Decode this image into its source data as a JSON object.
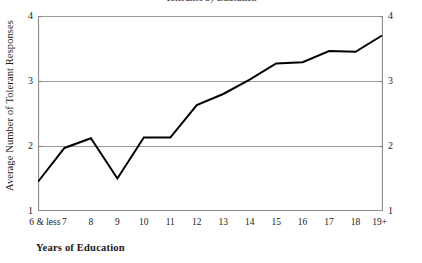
{
  "figure": {
    "title_remnant": "Tolerance by Education",
    "background": "#ffffff",
    "line_color": "#000000",
    "grid_color": "#9a9a9a",
    "axis_color": "#8c8c8c"
  },
  "chart_data": {
    "type": "line",
    "title": "",
    "xlabel": "Years of Education",
    "ylabel": "Average Number of Tolerant Responses",
    "categories": [
      "6 & less",
      "7",
      "8",
      "9",
      "10",
      "11",
      "12",
      "13",
      "14",
      "15",
      "16",
      "17",
      "18",
      "19+"
    ],
    "values": [
      1.45,
      1.97,
      2.12,
      1.5,
      2.13,
      2.13,
      2.63,
      2.8,
      3.02,
      3.27,
      3.29,
      3.46,
      3.45,
      3.7
    ],
    "series": [
      {
        "name": "Average Number of Tolerant Responses",
        "values": [
          1.45,
          1.97,
          2.12,
          1.5,
          2.13,
          2.13,
          2.63,
          2.8,
          3.02,
          3.27,
          3.29,
          3.46,
          3.45,
          3.7
        ]
      }
    ],
    "ylim": [
      1,
      4
    ],
    "yticks": [
      1,
      2,
      3,
      4
    ],
    "ytick_labels_left": [
      "1",
      "2",
      "3",
      "4"
    ],
    "ytick_labels_right": [
      "1",
      "2",
      "3",
      "4"
    ],
    "grid": "horizontal",
    "gridlines_at": [
      2,
      3,
      4
    ],
    "legend": "none",
    "legend_position": "none",
    "right_axis": true,
    "markers": "none",
    "line_width": 2
  }
}
